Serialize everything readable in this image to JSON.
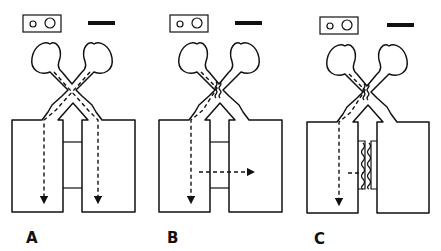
{
  "figure": {
    "panels": [
      {
        "label": "A",
        "crossing": "open",
        "flow": "both channels flow down separately",
        "membrane": "none"
      },
      {
        "label": "B",
        "crossing": "fused/wavy",
        "flow": "left channel down, lateral flow rightward across bridge",
        "membrane": "none"
      },
      {
        "label": "C",
        "crossing": "fused/wavy",
        "flow": "left channel down, lateral flow stops at membrane",
        "membrane": "wavy seal between legs"
      }
    ],
    "legend": {
      "box_icon": "two-circles-in-rectangle",
      "bar_icon": "scale-bar"
    },
    "colors": {
      "line": "#111111",
      "background": "#ffffff"
    }
  }
}
